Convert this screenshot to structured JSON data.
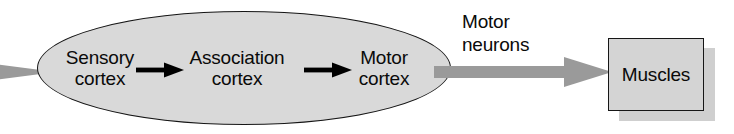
{
  "diagram": {
    "colors": {
      "ellipse_fill": "#d9d9d9",
      "ellipse_stroke": "#161616",
      "box_fill": "#d4d4d4",
      "box_stroke": "#161616",
      "box_shadow": "#cfcfcf",
      "gray_arrow": "#9a9a9a",
      "black_arrow": "#000000",
      "text": "#0a0a0a",
      "background": "#ffffff"
    },
    "incoming_arrow": {
      "name": "incoming-sensory-arrow",
      "color": "#9a9a9a",
      "direction": "right",
      "clipped": "left edge"
    },
    "cortex_group": {
      "shape": "ellipse",
      "nodes": [
        {
          "label": "Sensory\ncortex",
          "line1": "Sensory",
          "line2": "cortex"
        },
        {
          "label": "Association\ncortex",
          "line1": "Association",
          "line2": "cortex"
        },
        {
          "label": "Motor\ncortex",
          "line1": "Motor",
          "line2": "cortex"
        }
      ],
      "connectors": [
        {
          "name": "sensory-to-association-arrow",
          "color": "#000000",
          "direction": "right"
        },
        {
          "name": "association-to-motor-arrow",
          "color": "#000000",
          "direction": "right"
        }
      ]
    },
    "motor_pathway": {
      "caption_line1": "Motor",
      "caption_line2": "neurons",
      "arrow": {
        "name": "motor-neurons-arrow",
        "color": "#9a9a9a",
        "direction": "right"
      }
    },
    "target": {
      "shape": "rectangle",
      "label": "Muscles",
      "has_shadow": true
    }
  }
}
